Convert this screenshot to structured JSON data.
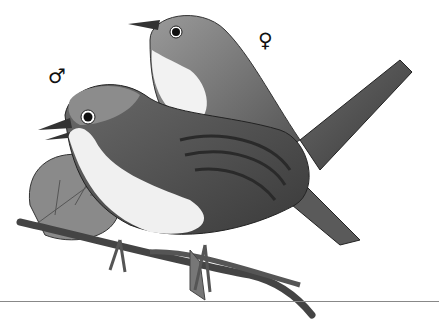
{
  "image": {
    "description": "Black-and-white illustration of two warblers (male and female) perched on a thorny bramble branch",
    "symbols": {
      "male": "♂",
      "female": "♀"
    },
    "colors": {
      "background": "#ffffff",
      "ink": "#111111"
    }
  }
}
